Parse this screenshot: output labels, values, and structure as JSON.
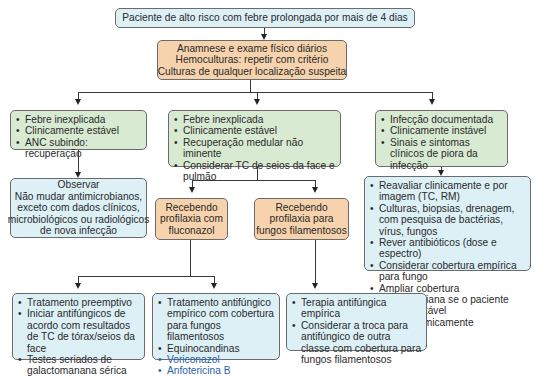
{
  "colors": {
    "blue_box": "#dcf0f6",
    "orange_box": "#f6d3ad",
    "green_box": "#d8ead2",
    "drug_text": "#2b5fa8",
    "border": "#6b6b6b"
  },
  "top": {
    "label": "Paciente de alto risco com febre prolongada por mais de 4 dias"
  },
  "evaluation": {
    "lines": [
      "Anamnese e exame físico diários",
      "Hemoculturas: repetir com critério",
      "Culturas de qualquer localização suspeita"
    ]
  },
  "branches": {
    "left": {
      "items": [
        "Febre inexplicada",
        "Clinicamente estável",
        "ANC subindo: recuperação"
      ]
    },
    "middle": {
      "items": [
        "Febre inexplicada",
        "Clinicamente estável",
        "Recuperação medular não iminente",
        "Considerar TC de seios da face e pulmão"
      ]
    },
    "right": {
      "items": [
        "Infecção documentada",
        "Clinicamente instável",
        "Sinais e sintomas clínicos de piora da infecção"
      ]
    }
  },
  "observe": {
    "lines": [
      "Observar",
      "Não mudar antimicrobianos,",
      "exceto com dados clínicos,",
      "microbiológicos ou radiológicos",
      "de nova infecção"
    ]
  },
  "prophylaxis": {
    "fluconazole": {
      "lines": [
        "Recebendo",
        "profilaxia com",
        "fluconazol"
      ]
    },
    "filamentous": {
      "lines": [
        "Recebendo",
        "profilaxia para",
        "fungos filamentosos"
      ]
    }
  },
  "reassess": {
    "items": [
      "Reavaliar clinicamente e por imagem (TC, RM)",
      "Culturas, biopsias, drenagem, com pesquisa de bactérias, vírus, fungos",
      "Rever antibióticos (dose e espectro)",
      "Considerar cobertura empírica para fungo",
      "Ampliar cobertura antimicrobiana se o paciente estiver instável hemodinamicamente"
    ]
  },
  "outcomes": {
    "preemptive": {
      "items": [
        "Tratamento preemptivo",
        "Iniciar antifúngicos de acordo com resultados de TC de tórax/seios da face",
        "Testes seriados de galactomanana sérica"
      ]
    },
    "empiric_coverage": {
      "items": [
        "Tratamento antifúngico empírico com cobertura para fungos filamentosos",
        "Equinocandinas"
      ],
      "drugs": [
        "Voriconazol",
        "Anfotericina B"
      ]
    },
    "switch_class": {
      "items": [
        "Terapia antifúngica empírica",
        "Considerar a troca para antifúngico de outra classe com cobertura para fungos filamentosos"
      ]
    }
  }
}
